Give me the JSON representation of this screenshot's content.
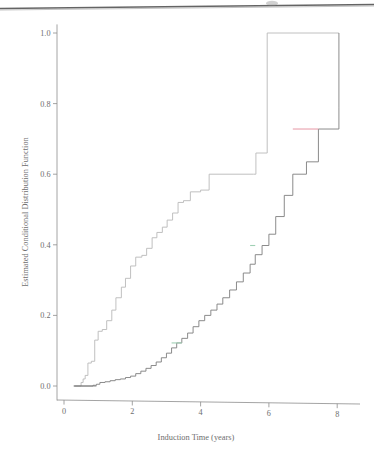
{
  "figure": {
    "background_color": "#ffffff",
    "scan_artifact": {
      "name": "page-edge-line",
      "color": "#3a3a3a",
      "description": "dark slanted scan edge across top of page"
    }
  },
  "chart_data": {
    "type": "line",
    "subtype": "step-function",
    "title": "",
    "xlabel": "Induction Time (years)",
    "ylabel": "Estimated Conditional Distribution Function",
    "xlim": [
      -0.35,
      8.6
    ],
    "ylim": [
      -0.02,
      1.03
    ],
    "xticks": [
      0,
      2,
      4,
      6,
      8
    ],
    "xtick_labels": [
      "0",
      "2",
      "4",
      "6",
      "8"
    ],
    "yticks": [
      0.0,
      0.2,
      0.4,
      0.6,
      0.8,
      1.0
    ],
    "ytick_labels": [
      "0.0",
      "0.2",
      "0.4",
      "0.6",
      "0.8",
      "1.0"
    ],
    "grid": false,
    "legend": "none",
    "axis_color": "#8d8d8d",
    "series": [
      {
        "name": "upper-curve",
        "color": "#b9b9b9",
        "style": "step-post",
        "x": [
          0.3,
          0.5,
          0.56,
          0.62,
          0.7,
          0.8,
          0.9,
          1.0,
          1.12,
          1.25,
          1.4,
          1.52,
          1.68,
          1.8,
          1.95,
          2.1,
          2.28,
          2.42,
          2.58,
          2.72,
          2.88,
          3.02,
          3.18,
          3.34,
          3.5,
          3.7,
          4.0,
          4.25,
          5.55,
          5.62,
          5.95,
          8.05
        ],
        "y": [
          0.0,
          0.01,
          0.02,
          0.03,
          0.065,
          0.07,
          0.13,
          0.155,
          0.16,
          0.185,
          0.215,
          0.25,
          0.28,
          0.305,
          0.34,
          0.365,
          0.37,
          0.39,
          0.42,
          0.435,
          0.45,
          0.47,
          0.49,
          0.52,
          0.525,
          0.55,
          0.555,
          0.6,
          0.6,
          0.66,
          1.0,
          1.0
        ]
      },
      {
        "name": "lower-curve",
        "color": "#7e7e7e",
        "style": "step-post",
        "x": [
          0.3,
          0.85,
          0.95,
          1.05,
          1.2,
          1.35,
          1.5,
          1.65,
          1.8,
          1.95,
          2.1,
          2.25,
          2.4,
          2.55,
          2.7,
          2.85,
          3.0,
          3.15,
          3.3,
          3.45,
          3.62,
          3.78,
          3.95,
          4.12,
          4.3,
          4.48,
          4.65,
          4.85,
          5.05,
          5.25,
          5.45,
          5.6,
          5.8,
          6.0,
          6.2,
          6.45,
          6.7,
          7.1,
          7.45,
          8.05
        ],
        "y": [
          0.0,
          0.002,
          0.005,
          0.01,
          0.012,
          0.015,
          0.018,
          0.02,
          0.024,
          0.028,
          0.035,
          0.042,
          0.05,
          0.058,
          0.068,
          0.08,
          0.093,
          0.108,
          0.122,
          0.135,
          0.15,
          0.168,
          0.185,
          0.2,
          0.215,
          0.232,
          0.25,
          0.272,
          0.295,
          0.32,
          0.345,
          0.372,
          0.398,
          0.43,
          0.48,
          0.54,
          0.6,
          0.635,
          0.728,
          0.79
        ]
      }
    ],
    "highlighted_segments": [
      {
        "name": "green-segment-lower-left",
        "color": "#9fd0b4",
        "x_start": 3.15,
        "x_end": 3.45,
        "y": 0.122
      },
      {
        "name": "green-segment-lower-mid",
        "color": "#9fd0b4",
        "x_start": 5.45,
        "x_end": 5.6,
        "y": 0.398
      },
      {
        "name": "red-segment-lower-right",
        "color": "#e8a0ac",
        "x_start": 6.7,
        "x_end": 7.45,
        "y": 0.728
      }
    ]
  }
}
